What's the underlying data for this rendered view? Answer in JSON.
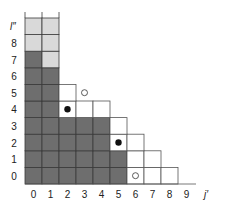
{
  "diagram": {
    "x_axis_label": "j′",
    "y_axis_label": "l″",
    "x_ticks": [
      "0",
      "1",
      "2",
      "3",
      "4",
      "5",
      "6",
      "7",
      "8",
      "9"
    ],
    "y_ticks": [
      "0",
      "1",
      "2",
      "3",
      "4",
      "5",
      "6",
      "7",
      "8"
    ],
    "colors": {
      "dark": "#6e6e6e",
      "light": "#d9d9d9",
      "white": "#ffffff",
      "line": "#3a3a3a",
      "box_line": "#555555"
    },
    "cells": [
      {
        "col": 0,
        "row": 0,
        "fill": "dark"
      },
      {
        "col": 1,
        "row": 0,
        "fill": "dark"
      },
      {
        "col": 2,
        "row": 0,
        "fill": "dark"
      },
      {
        "col": 3,
        "row": 0,
        "fill": "dark"
      },
      {
        "col": 4,
        "row": 0,
        "fill": "dark"
      },
      {
        "col": 5,
        "row": 0,
        "fill": "dark"
      },
      {
        "col": 6,
        "row": 0,
        "fill": "white"
      },
      {
        "col": 7,
        "row": 0,
        "fill": "white"
      },
      {
        "col": 8,
        "row": 0,
        "fill": "white"
      },
      {
        "col": 0,
        "row": 1,
        "fill": "dark"
      },
      {
        "col": 1,
        "row": 1,
        "fill": "dark"
      },
      {
        "col": 2,
        "row": 1,
        "fill": "dark"
      },
      {
        "col": 3,
        "row": 1,
        "fill": "dark"
      },
      {
        "col": 4,
        "row": 1,
        "fill": "dark"
      },
      {
        "col": 5,
        "row": 1,
        "fill": "dark"
      },
      {
        "col": 6,
        "row": 1,
        "fill": "white"
      },
      {
        "col": 7,
        "row": 1,
        "fill": "white"
      },
      {
        "col": 0,
        "row": 2,
        "fill": "dark"
      },
      {
        "col": 1,
        "row": 2,
        "fill": "dark"
      },
      {
        "col": 2,
        "row": 2,
        "fill": "dark"
      },
      {
        "col": 3,
        "row": 2,
        "fill": "dark"
      },
      {
        "col": 4,
        "row": 2,
        "fill": "dark"
      },
      {
        "col": 5,
        "row": 2,
        "fill": "white"
      },
      {
        "col": 6,
        "row": 2,
        "fill": "white"
      },
      {
        "col": 0,
        "row": 3,
        "fill": "dark"
      },
      {
        "col": 1,
        "row": 3,
        "fill": "dark"
      },
      {
        "col": 2,
        "row": 3,
        "fill": "dark"
      },
      {
        "col": 3,
        "row": 3,
        "fill": "dark"
      },
      {
        "col": 4,
        "row": 3,
        "fill": "dark"
      },
      {
        "col": 5,
        "row": 3,
        "fill": "white"
      },
      {
        "col": 0,
        "row": 4,
        "fill": "dark"
      },
      {
        "col": 1,
        "row": 4,
        "fill": "dark"
      },
      {
        "col": 2,
        "row": 4,
        "fill": "white"
      },
      {
        "col": 3,
        "row": 4,
        "fill": "white"
      },
      {
        "col": 4,
        "row": 4,
        "fill": "white"
      },
      {
        "col": 0,
        "row": 5,
        "fill": "dark"
      },
      {
        "col": 1,
        "row": 5,
        "fill": "dark"
      },
      {
        "col": 2,
        "row": 5,
        "fill": "white"
      },
      {
        "col": 0,
        "row": 6,
        "fill": "dark"
      },
      {
        "col": 1,
        "row": 6,
        "fill": "dark"
      },
      {
        "col": 0,
        "row": 7,
        "fill": "dark"
      },
      {
        "col": 1,
        "row": 7,
        "fill": "light"
      },
      {
        "col": 0,
        "row": 8,
        "fill": "light"
      },
      {
        "col": 1,
        "row": 8,
        "fill": "light"
      },
      {
        "col": 0,
        "row": 9,
        "fill": "light"
      },
      {
        "col": 1,
        "row": 9,
        "fill": "light"
      }
    ],
    "markers": [
      {
        "col": 2,
        "row": 4,
        "type": "filled-dot"
      },
      {
        "col": 5,
        "row": 2,
        "type": "filled-dot"
      },
      {
        "col": 3,
        "row": 5,
        "type": "open-circle"
      },
      {
        "col": 6,
        "row": 0,
        "type": "open-circle"
      }
    ]
  }
}
